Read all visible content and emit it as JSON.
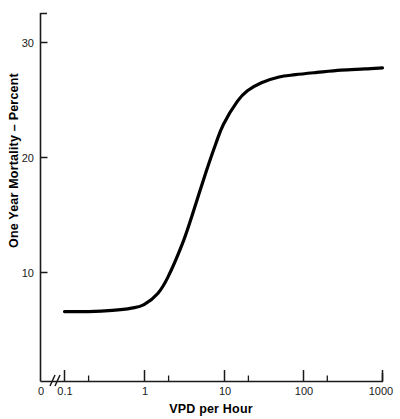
{
  "chart_data": {
    "type": "line",
    "title": "",
    "xlabel": "VPD per Hour",
    "ylabel": "One Year Mortality – Percent",
    "x_scale": "log",
    "x_tick_labels": [
      "0",
      "0.1",
      "1",
      "10",
      "100",
      "1000"
    ],
    "x_tick_values": [
      0,
      0.1,
      1,
      10,
      100,
      1000
    ],
    "y_tick_labels": [
      "10",
      "20",
      "30"
    ],
    "y_tick_values": [
      10,
      20,
      30
    ],
    "xlim": [
      0.1,
      1000
    ],
    "ylim": [
      0,
      33.6
    ],
    "grid": false,
    "legend": "none",
    "axis_break_after_zero": true,
    "series": [
      {
        "name": "One Year Mortality",
        "x": [
          0.1,
          0.2,
          0.4,
          0.7,
          1.0,
          1.5,
          2.0,
          3.0,
          4.0,
          6.0,
          8.0,
          10.0,
          15.0,
          20.0,
          30.0,
          50.0,
          80.0,
          150.0,
          300.0,
          600.0,
          1000.0
        ],
        "y": [
          6.6,
          6.6,
          6.7,
          6.9,
          7.2,
          8.2,
          9.6,
          12.4,
          14.9,
          18.7,
          21.2,
          22.9,
          24.9,
          25.8,
          26.5,
          27.0,
          27.2,
          27.4,
          27.6,
          27.7,
          27.8
        ]
      }
    ],
    "annotations": []
  },
  "axes": {
    "y_label": "One Year Mortality – Percent",
    "x_label": "VPD per Hour",
    "y_ticks": [
      "30",
      "20",
      "10"
    ],
    "x_ticks": [
      "0",
      "0.1",
      "1",
      "10",
      "100",
      "1000"
    ]
  },
  "colors": {
    "curve": "#000000",
    "axis": "#1a1a1a",
    "background": "#ffffff"
  }
}
